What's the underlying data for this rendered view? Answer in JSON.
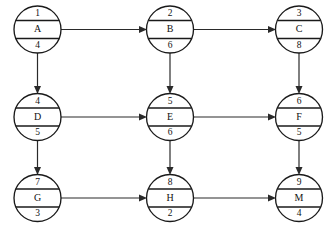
{
  "diagram": {
    "node_shape": "circle-three-bands",
    "colors": {
      "background": "#ffffff",
      "stroke": "#1a1a1a",
      "edge": "#2a2a2a",
      "text": "#111111"
    },
    "nodes": [
      {
        "id": "A",
        "row": 0,
        "col": 0,
        "top": "1",
        "middle": "A",
        "bottom": "4"
      },
      {
        "id": "B",
        "row": 0,
        "col": 1,
        "top": "2",
        "middle": "B",
        "bottom": "6"
      },
      {
        "id": "C",
        "row": 0,
        "col": 2,
        "top": "3",
        "middle": "C",
        "bottom": "8"
      },
      {
        "id": "D",
        "row": 1,
        "col": 0,
        "top": "4",
        "middle": "D",
        "bottom": "5"
      },
      {
        "id": "E",
        "row": 1,
        "col": 1,
        "top": "5",
        "middle": "E",
        "bottom": "6"
      },
      {
        "id": "F",
        "row": 1,
        "col": 2,
        "top": "6",
        "middle": "F",
        "bottom": "5"
      },
      {
        "id": "G",
        "row": 2,
        "col": 0,
        "top": "7",
        "middle": "G",
        "bottom": "3"
      },
      {
        "id": "H",
        "row": 2,
        "col": 1,
        "top": "8",
        "middle": "H",
        "bottom": "2"
      },
      {
        "id": "M",
        "row": 2,
        "col": 2,
        "top": "9",
        "middle": "M",
        "bottom": "4"
      }
    ],
    "edges": [
      {
        "from": "A",
        "to": "B",
        "direction": "horizontal"
      },
      {
        "from": "B",
        "to": "C",
        "direction": "horizontal"
      },
      {
        "from": "D",
        "to": "E",
        "direction": "horizontal"
      },
      {
        "from": "E",
        "to": "F",
        "direction": "horizontal"
      },
      {
        "from": "G",
        "to": "H",
        "direction": "horizontal"
      },
      {
        "from": "H",
        "to": "M",
        "direction": "horizontal"
      },
      {
        "from": "A",
        "to": "D",
        "direction": "vertical"
      },
      {
        "from": "D",
        "to": "G",
        "direction": "vertical"
      },
      {
        "from": "B",
        "to": "E",
        "direction": "vertical"
      },
      {
        "from": "E",
        "to": "H",
        "direction": "vertical"
      },
      {
        "from": "C",
        "to": "F",
        "direction": "vertical"
      },
      {
        "from": "F",
        "to": "M",
        "direction": "vertical"
      }
    ]
  }
}
